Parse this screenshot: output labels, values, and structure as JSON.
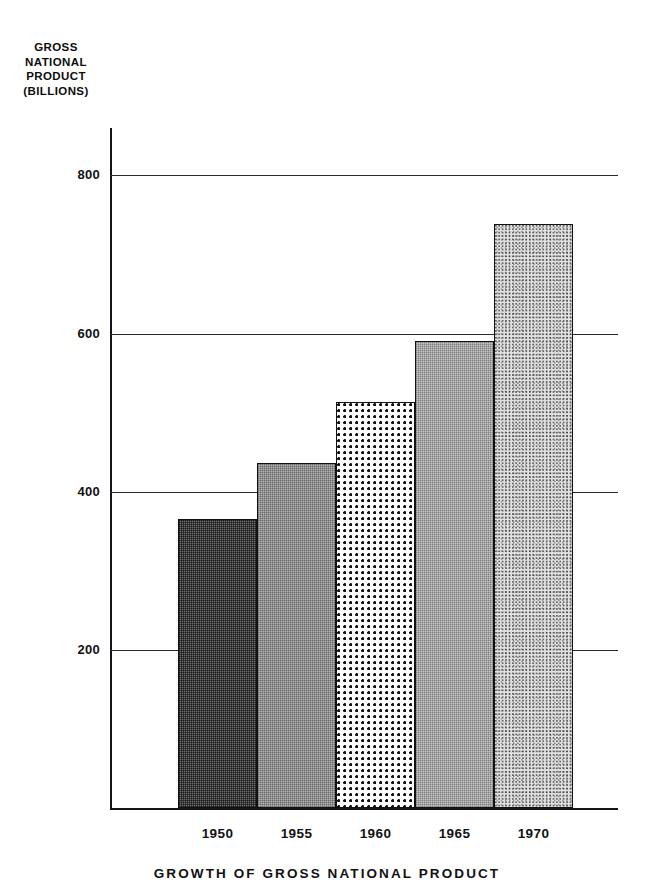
{
  "chart_data": {
    "type": "bar",
    "title": "GROWTH OF GROSS NATIONAL PRODUCT",
    "xlabel": "",
    "ylabel": "GROSS NATIONAL PRODUCT (BILLIONS)",
    "ylabel_lines": [
      "GROSS",
      "NATIONAL",
      "PRODUCT",
      "(BILLIONS)"
    ],
    "categories": [
      "1950",
      "1955",
      "1960",
      "1965",
      "1970"
    ],
    "values": [
      366,
      436,
      514,
      591,
      739
    ],
    "ylim": [
      0,
      860
    ],
    "yticks": [
      200,
      400,
      600,
      800
    ],
    "ytick_labels": [
      "200",
      "400",
      "600",
      "800"
    ],
    "grid": true,
    "grid_axis": "y",
    "legend": "none",
    "bar_fills": [
      "fill-dark-check",
      "fill-mid-gray",
      "fill-coarse-dots",
      "fill-light-gray",
      "fill-fine-stipple"
    ],
    "bar_fill_names": [
      "dark-checkerboard",
      "medium-gray",
      "coarse-dot-grid",
      "light-gray",
      "fine-stipple"
    ],
    "colors": {
      "axis": "#141414",
      "grid": "#2b2b2b",
      "text": "#111111",
      "background": "#ffffff"
    }
  }
}
